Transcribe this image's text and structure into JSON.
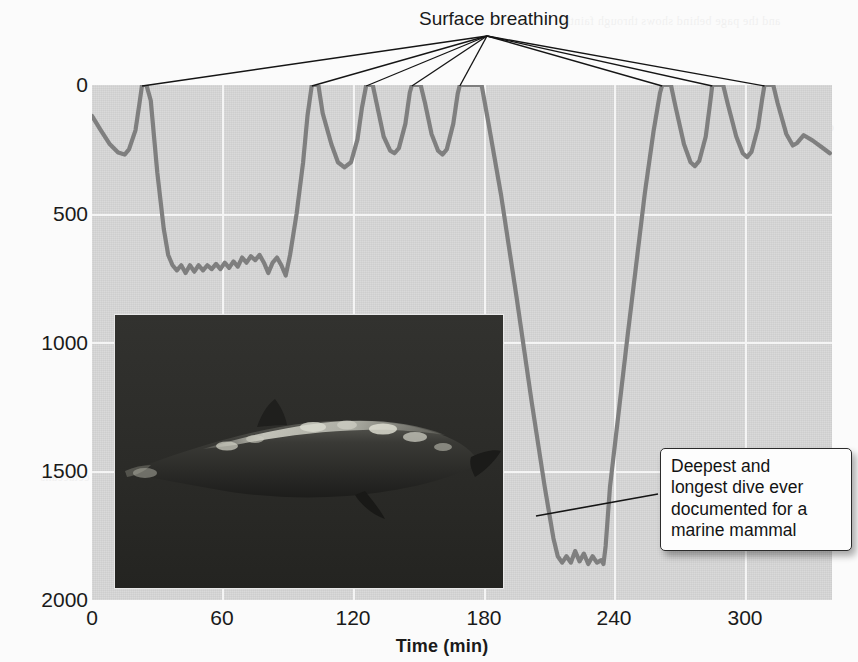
{
  "chart_data": {
    "type": "line",
    "title": "",
    "xlabel": "Time (min)",
    "ylabel": "Depth (m)",
    "xlim": [
      0,
      340
    ],
    "ylim": [
      2000,
      0
    ],
    "xticks": [
      0,
      60,
      120,
      180,
      240,
      300
    ],
    "xtick_labels": [
      "0",
      "60",
      "120",
      "180",
      "240",
      "300"
    ],
    "yticks": [
      0,
      500,
      1000,
      1500,
      2000
    ],
    "ytick_labels": [
      "0",
      "500",
      "1000",
      "1500",
      "2000"
    ],
    "grid": true,
    "legend": "none",
    "series": [
      {
        "name": "Dive profile",
        "color": "#7f7f7f",
        "points": [
          [
            0,
            120
          ],
          [
            4,
            175
          ],
          [
            8,
            228
          ],
          [
            12,
            262
          ],
          [
            15,
            270
          ],
          [
            17,
            250
          ],
          [
            20,
            175
          ],
          [
            22,
            60
          ],
          [
            23,
            0
          ],
          [
            25,
            0
          ],
          [
            27,
            60
          ],
          [
            30,
            340
          ],
          [
            33,
            560
          ],
          [
            35,
            660
          ],
          [
            37,
            700
          ],
          [
            39,
            720
          ],
          [
            41,
            700
          ],
          [
            43,
            730
          ],
          [
            45,
            700
          ],
          [
            47,
            725
          ],
          [
            49,
            700
          ],
          [
            51,
            720
          ],
          [
            53,
            700
          ],
          [
            55,
            715
          ],
          [
            57,
            695
          ],
          [
            59,
            715
          ],
          [
            61,
            690
          ],
          [
            63,
            710
          ],
          [
            65,
            685
          ],
          [
            67,
            705
          ],
          [
            69,
            670
          ],
          [
            71,
            690
          ],
          [
            73,
            665
          ],
          [
            75,
            680
          ],
          [
            77,
            660
          ],
          [
            79,
            690
          ],
          [
            81,
            730
          ],
          [
            83,
            690
          ],
          [
            85,
            670
          ],
          [
            87,
            700
          ],
          [
            89,
            740
          ],
          [
            91,
            660
          ],
          [
            94,
            500
          ],
          [
            97,
            300
          ],
          [
            99,
            120
          ],
          [
            101,
            0
          ],
          [
            104,
            0
          ],
          [
            106,
            110
          ],
          [
            110,
            230
          ],
          [
            113,
            300
          ],
          [
            116,
            320
          ],
          [
            119,
            300
          ],
          [
            122,
            210
          ],
          [
            124,
            90
          ],
          [
            126,
            0
          ],
          [
            129,
            0
          ],
          [
            131,
            80
          ],
          [
            134,
            200
          ],
          [
            137,
            255
          ],
          [
            139,
            265
          ],
          [
            141,
            245
          ],
          [
            144,
            150
          ],
          [
            146,
            30
          ],
          [
            147,
            0
          ],
          [
            151,
            0
          ],
          [
            153,
            70
          ],
          [
            156,
            190
          ],
          [
            159,
            255
          ],
          [
            161,
            270
          ],
          [
            163,
            250
          ],
          [
            166,
            150
          ],
          [
            168,
            35
          ],
          [
            169,
            0
          ],
          [
            179,
            0
          ],
          [
            182,
            140
          ],
          [
            188,
            430
          ],
          [
            195,
            820
          ],
          [
            202,
            1230
          ],
          [
            208,
            1560
          ],
          [
            212,
            1760
          ],
          [
            214,
            1830
          ],
          [
            216,
            1855
          ],
          [
            218,
            1830
          ],
          [
            220,
            1855
          ],
          [
            222,
            1810
          ],
          [
            224,
            1850
          ],
          [
            226,
            1820
          ],
          [
            228,
            1860
          ],
          [
            230,
            1830
          ],
          [
            232,
            1855
          ],
          [
            234,
            1845
          ],
          [
            235,
            1860
          ],
          [
            236,
            1790
          ],
          [
            238,
            1560
          ],
          [
            242,
            1270
          ],
          [
            246,
            980
          ],
          [
            250,
            700
          ],
          [
            254,
            420
          ],
          [
            258,
            180
          ],
          [
            261,
            30
          ],
          [
            262,
            0
          ],
          [
            266,
            0
          ],
          [
            268,
            80
          ],
          [
            272,
            230
          ],
          [
            275,
            300
          ],
          [
            277,
            315
          ],
          [
            279,
            295
          ],
          [
            282,
            200
          ],
          [
            284,
            70
          ],
          [
            285,
            0
          ],
          [
            290,
            0
          ],
          [
            292,
            70
          ],
          [
            296,
            200
          ],
          [
            299,
            265
          ],
          [
            301,
            280
          ],
          [
            303,
            260
          ],
          [
            306,
            165
          ],
          [
            308,
            50
          ],
          [
            309,
            0
          ],
          [
            313,
            0
          ],
          [
            315,
            70
          ],
          [
            319,
            190
          ],
          [
            322,
            235
          ],
          [
            324,
            225
          ],
          [
            327,
            195
          ],
          [
            331,
            215
          ],
          [
            335,
            240
          ],
          [
            339,
            265
          ]
        ]
      }
    ],
    "annotations": [
      {
        "name": "surface-breathing",
        "text": "Surface breathing",
        "points_to": [
          23,
          101,
          126,
          147,
          169,
          262,
          285,
          309
        ]
      },
      {
        "name": "deepest-dive",
        "lines": [
          "Deepest and",
          "longest dive ever",
          "documented for a",
          "marine mammal"
        ],
        "points_to": [
          215,
          1810
        ]
      }
    ],
    "inset_photo": {
      "name": "beaked-whale-photo",
      "description": "Underwater photograph of a beaked whale",
      "background_color": "#2a2a2a"
    },
    "colors": {
      "plot_background": "#d6d6d6",
      "gridline": "#f4f4f4",
      "line": "#7f7f7f",
      "text": "#1a1a1a",
      "page_background": "#fbfbfb"
    }
  },
  "axes": {
    "y_title": "Depth (m)",
    "x_title": "Time (min)"
  },
  "callouts": {
    "surface": "Surface breathing",
    "deepest": {
      "line1": "Deepest and",
      "line2": "longest dive ever",
      "line3": "documented for a",
      "line4": "marine mammal"
    }
  },
  "ghost_text": [
    "and the page behind shows through faintly",
    "dive profiles recorded by satellite tag",
    "Cuvier's beaked whale Ziphius cavirostris",
    "SYSTEMS",
    "physiological adaptations to pressure",
    "extended breath-hold capacity in cetaceans"
  ]
}
